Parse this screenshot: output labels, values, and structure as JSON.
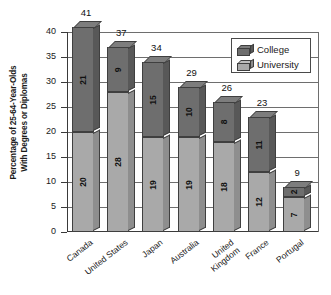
{
  "chart_data": {
    "type": "bar",
    "subtype": "stacked-bar-3d",
    "title": "",
    "xlabel": "",
    "ylabel": "Percentage of 25-64-Year-Olds With Degrees or Diplomas",
    "ylabel_lines": [
      "Percentage of 25-64-Year-Olds",
      "With Degrees or Diplomas"
    ],
    "ylim": [
      0,
      40
    ],
    "ytick_step": 5,
    "yticks": [
      40,
      35,
      30,
      25,
      20,
      15,
      10,
      5,
      0
    ],
    "grid": true,
    "grid_axis": "y",
    "legend_position": "top-right-inside",
    "categories": [
      "Canada",
      "United States",
      "Japan",
      "Australia",
      "United Kingdom",
      "France",
      "Portugal"
    ],
    "category_label_lines": [
      [
        "Canada"
      ],
      [
        "United States"
      ],
      [
        "Japan"
      ],
      [
        "Australia"
      ],
      [
        "United",
        "Kingdom"
      ],
      [
        "France"
      ],
      [
        "Portugal"
      ]
    ],
    "series": [
      {
        "name": "University",
        "color": "#a9a9a9",
        "stack_position": "bottom",
        "values": [
          20,
          28,
          19,
          19,
          18,
          12,
          7
        ]
      },
      {
        "name": "College",
        "color": "#6e6e6e",
        "stack_position": "top",
        "values": [
          21,
          9,
          15,
          10,
          8,
          11,
          2
        ]
      }
    ],
    "totals": [
      41,
      37,
      34,
      29,
      26,
      23,
      9
    ],
    "total_labels": [
      "41",
      "37",
      "34",
      "29",
      "26",
      "23",
      "9"
    ]
  },
  "legend": {
    "items": [
      {
        "label": "College",
        "color": "#6e6e6e"
      },
      {
        "label": "University",
        "color": "#a9a9a9"
      }
    ]
  },
  "axis": {
    "ytick_labels": [
      "40",
      "35",
      "30",
      "25",
      "20",
      "15",
      "10",
      "5",
      "0"
    ]
  }
}
